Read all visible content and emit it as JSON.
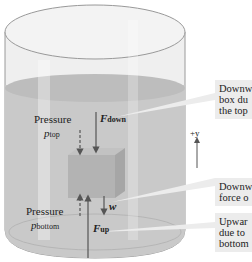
{
  "diagram": {
    "colors": {
      "glass": "#e9e9e9",
      "glass_edge": "#9a9a9a",
      "water": "#c6c6c6",
      "water_surface": "#bdbdbd",
      "box": "#b3b3b3",
      "arrow": "#555555",
      "callout_bg": "#ececec"
    },
    "labels": {
      "pressure_top": "Pressure",
      "p_top_symbol": "p",
      "p_top_sub": "top",
      "f_down_symbol": "F",
      "f_down_sub": "down",
      "axis_label": "+y",
      "weight_symbol": "w",
      "pressure_bottom": "Pressure",
      "p_bottom_symbol": "p",
      "p_bottom_sub": "bottom",
      "f_up_symbol": "F",
      "f_up_sub": "up"
    },
    "callouts": [
      {
        "line1": "Downw",
        "line2": "box du",
        "line3": "the top"
      },
      {
        "line1": "Downw",
        "line2": "force o",
        "line3": ""
      },
      {
        "line1": "Upwar",
        "line2": "due to",
        "line3": "bottom"
      }
    ]
  }
}
